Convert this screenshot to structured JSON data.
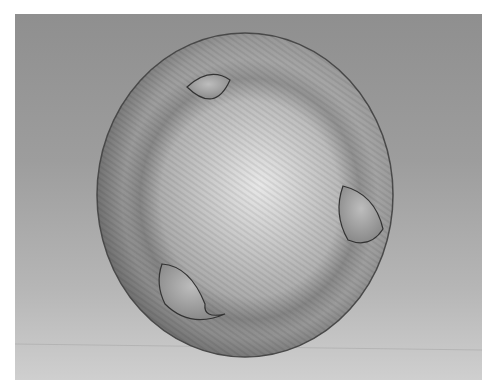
{
  "scene": {
    "description": "Grayscale 3D render of a sphere with three dimpled notches on a gradient background",
    "colors": {
      "background_top": "#8f8f8f",
      "background_bottom": "#cfcfcf",
      "sphere_rim": "#555555",
      "sphere_highlight": "#e6e6e6",
      "border": "#ffffff"
    },
    "sphere": {
      "cx": 230,
      "cy": 181,
      "rx": 148,
      "ry": 162
    },
    "dimples": [
      {
        "name": "top-left",
        "cx": 200,
        "cy": 73
      },
      {
        "name": "right",
        "cx": 340,
        "cy": 210
      },
      {
        "name": "bottom-left",
        "cx": 180,
        "cy": 287
      }
    ]
  }
}
